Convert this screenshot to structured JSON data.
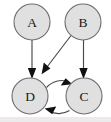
{
  "figure": {
    "type": "directed-graph",
    "background_color": "#ffffff",
    "node_fill": "#e0e0e0",
    "node_stroke": "#6e6e6e",
    "edge_color": "#4a4a4a",
    "arrowhead_color": "#111111",
    "label_color": "#1a1a1a"
  },
  "nodes": [
    {
      "id": "A",
      "label": "A",
      "cx": 32,
      "cy": 22,
      "r": 18
    },
    {
      "id": "B",
      "label": "B",
      "cx": 83,
      "cy": 22,
      "r": 18
    },
    {
      "id": "D",
      "label": "D",
      "cx": 30,
      "cy": 96,
      "r": 18
    },
    {
      "id": "C",
      "label": "C",
      "cx": 84,
      "cy": 96,
      "r": 18
    }
  ],
  "edges": [
    {
      "id": "A-D",
      "from": "A",
      "to": "D",
      "style": "straight",
      "label": "A to D"
    },
    {
      "id": "B-C",
      "from": "B",
      "to": "C",
      "style": "straight",
      "label": "B to C"
    },
    {
      "id": "B-D",
      "from": "B",
      "to": "D",
      "style": "straight",
      "label": "B to D"
    },
    {
      "id": "D-C",
      "from": "D",
      "to": "C",
      "style": "curved-upper",
      "label": "D to C"
    },
    {
      "id": "C-D",
      "from": "C",
      "to": "D",
      "style": "curved-lower",
      "label": "C to D"
    }
  ]
}
